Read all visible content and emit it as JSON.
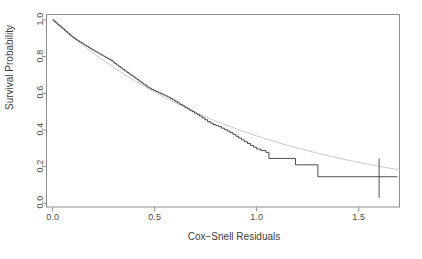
{
  "chart_data": {
    "type": "line",
    "title": "",
    "xlabel": "Cox−Snell Residuals",
    "ylabel": "Survival Probability",
    "xlim": [
      -0.03,
      1.7
    ],
    "ylim": [
      -0.02,
      1.03
    ],
    "xticks": [
      0.0,
      0.5,
      1.0,
      1.5
    ],
    "xticklabels": [
      "0.0",
      "0.5",
      "1.0",
      "1.5"
    ],
    "yticks": [
      0.0,
      0.2,
      0.4,
      0.6,
      0.8,
      1.0
    ],
    "yticklabels": [
      "0.0",
      "0.2",
      "0.4",
      "0.6",
      "0.8",
      "1.0"
    ],
    "grid": false,
    "legend": "none",
    "box": true,
    "series": [
      {
        "name": "Kaplan-Meier estimate of Cox-Snell residuals",
        "style": "step",
        "color": "#3a3a3a",
        "width": 0.9,
        "x": [
          0.0,
          0.008,
          0.016,
          0.024,
          0.032,
          0.042,
          0.05,
          0.058,
          0.066,
          0.074,
          0.082,
          0.09,
          0.099,
          0.108,
          0.116,
          0.124,
          0.133,
          0.142,
          0.15,
          0.158,
          0.167,
          0.176,
          0.184,
          0.193,
          0.202,
          0.212,
          0.221,
          0.23,
          0.24,
          0.25,
          0.259,
          0.268,
          0.277,
          0.287,
          0.296,
          0.305,
          0.314,
          0.324,
          0.334,
          0.344,
          0.354,
          0.364,
          0.374,
          0.384,
          0.394,
          0.404,
          0.414,
          0.424,
          0.434,
          0.444,
          0.454,
          0.464,
          0.474,
          0.484,
          0.495,
          0.506,
          0.517,
          0.528,
          0.54,
          0.552,
          0.564,
          0.576,
          0.588,
          0.6,
          0.612,
          0.624,
          0.636,
          0.648,
          0.66,
          0.672,
          0.684,
          0.696,
          0.708,
          0.72,
          0.733,
          0.746,
          0.759,
          0.772,
          0.786,
          0.8,
          0.814,
          0.828,
          0.842,
          0.856,
          0.87,
          0.884,
          0.898,
          0.912,
          0.926,
          0.94,
          0.955,
          0.97,
          0.985,
          1.0,
          1.02,
          1.045,
          1.06,
          1.13,
          1.19,
          1.205,
          1.225,
          1.3,
          1.6,
          1.6,
          1.69
        ],
        "y": [
          1.0,
          0.992,
          0.984,
          0.976,
          0.968,
          0.96,
          0.952,
          0.944,
          0.936,
          0.928,
          0.92,
          0.912,
          0.905,
          0.898,
          0.892,
          0.886,
          0.88,
          0.874,
          0.868,
          0.862,
          0.856,
          0.85,
          0.844,
          0.838,
          0.832,
          0.826,
          0.82,
          0.814,
          0.808,
          0.802,
          0.796,
          0.79,
          0.784,
          0.778,
          0.77,
          0.762,
          0.754,
          0.746,
          0.738,
          0.73,
          0.722,
          0.714,
          0.706,
          0.698,
          0.69,
          0.682,
          0.674,
          0.666,
          0.658,
          0.65,
          0.642,
          0.634,
          0.628,
          0.622,
          0.616,
          0.61,
          0.604,
          0.598,
          0.592,
          0.586,
          0.58,
          0.572,
          0.564,
          0.556,
          0.548,
          0.54,
          0.532,
          0.524,
          0.516,
          0.508,
          0.5,
          0.492,
          0.484,
          0.476,
          0.466,
          0.456,
          0.446,
          0.438,
          0.43,
          0.424,
          0.418,
          0.41,
          0.402,
          0.394,
          0.386,
          0.376,
          0.366,
          0.356,
          0.346,
          0.336,
          0.326,
          0.316,
          0.306,
          0.296,
          0.288,
          0.278,
          0.245,
          0.245,
          0.21,
          0.21,
          0.21,
          0.145,
          0.145,
          0.145,
          0.145
        ],
        "censor_marks": [
          {
            "x": 1.6,
            "y_top": 0.245,
            "y_bottom": 0.03
          }
        ]
      },
      {
        "name": "Theoretical unit exponential survival exp(-x)",
        "style": "smooth",
        "color": "#bcbcbc",
        "width": 0.8,
        "x": [
          0.0,
          0.05,
          0.1,
          0.15,
          0.2,
          0.25,
          0.3,
          0.35,
          0.4,
          0.45,
          0.5,
          0.55,
          0.6,
          0.65,
          0.7,
          0.75,
          0.8,
          0.85,
          0.9,
          0.95,
          1.0,
          1.05,
          1.1,
          1.15,
          1.2,
          1.25,
          1.3,
          1.35,
          1.4,
          1.45,
          1.5,
          1.55,
          1.6,
          1.65,
          1.7
        ],
        "y": [
          1.0,
          0.951,
          0.905,
          0.861,
          0.819,
          0.779,
          0.741,
          0.705,
          0.67,
          0.638,
          0.607,
          0.577,
          0.549,
          0.522,
          0.497,
          0.472,
          0.449,
          0.427,
          0.407,
          0.387,
          0.368,
          0.35,
          0.333,
          0.317,
          0.301,
          0.287,
          0.273,
          0.259,
          0.247,
          0.235,
          0.223,
          0.212,
          0.202,
          0.192,
          0.183
        ]
      }
    ],
    "colors": {
      "km_curve": "#3a3a3a",
      "reference_curve": "#bcbcbc",
      "axis": "#8c8c8c",
      "text": "#4d4d4d",
      "background": "#ffffff"
    }
  },
  "axes": {
    "x": {
      "title": "Cox−Snell Residuals",
      "ticks": [
        {
          "value": 0.0,
          "label": "0.0"
        },
        {
          "value": 0.5,
          "label": "0.5"
        },
        {
          "value": 1.0,
          "label": "1.0"
        },
        {
          "value": 1.5,
          "label": "1.5"
        }
      ]
    },
    "y": {
      "title": "Survival Probability",
      "ticks": [
        {
          "value": 0.0,
          "label": "0.0"
        },
        {
          "value": 0.2,
          "label": "0.2"
        },
        {
          "value": 0.4,
          "label": "0.4"
        },
        {
          "value": 0.6,
          "label": "0.6"
        },
        {
          "value": 0.8,
          "label": "0.8"
        },
        {
          "value": 1.0,
          "label": "1.0"
        }
      ]
    }
  }
}
